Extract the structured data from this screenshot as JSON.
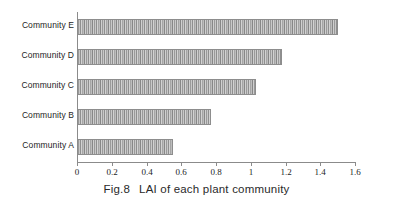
{
  "chart_data": {
    "type": "bar",
    "orientation": "horizontal",
    "caption_prefix": "Fig.8",
    "caption_text": "LAI of each plant community",
    "categories": [
      "Community A",
      "Community B",
      "Community C",
      "Community D",
      "Community E"
    ],
    "values": [
      0.54,
      0.76,
      1.02,
      1.17,
      1.49
    ],
    "display_order_top_to_bottom": [
      "Community E",
      "Community D",
      "Community C",
      "Community B",
      "Community A"
    ],
    "xlabel": "",
    "ylabel": "",
    "xlim": [
      0,
      1.6
    ],
    "xticks": [
      0,
      0.2,
      0.4,
      0.6,
      0.8,
      1,
      1.2,
      1.4,
      1.6
    ],
    "xtick_labels": [
      "0",
      "0.2",
      "0.4",
      "0.6",
      "0.8",
      "1",
      "1.2",
      "1.4",
      "1.6"
    ],
    "grid": false,
    "legend": false,
    "bar_fill": "#b9b9b9",
    "bar_edge": "#8d8d8d",
    "axis_color": "#8b8b8b",
    "text_color": "#1d1d1d",
    "background": "#ffffff"
  },
  "bars": [
    {
      "label": "Community E",
      "value": 1.49
    },
    {
      "label": "Community D",
      "value": 1.17
    },
    {
      "label": "Community C",
      "value": 1.02
    },
    {
      "label": "Community B",
      "value": 0.76
    },
    {
      "label": "Community A",
      "value": 0.54
    }
  ],
  "ticks": [
    {
      "label": "0",
      "value": 0
    },
    {
      "label": "0.2",
      "value": 0.2
    },
    {
      "label": "0.4",
      "value": 0.4
    },
    {
      "label": "0.6",
      "value": 0.6
    },
    {
      "label": "0.8",
      "value": 0.8
    },
    {
      "label": "1",
      "value": 1
    },
    {
      "label": "1.2",
      "value": 1.2
    },
    {
      "label": "1.4",
      "value": 1.4
    },
    {
      "label": "1.6",
      "value": 1.6
    }
  ],
  "caption": {
    "figure_number": "Fig.8",
    "text": "LAI of each plant community"
  }
}
